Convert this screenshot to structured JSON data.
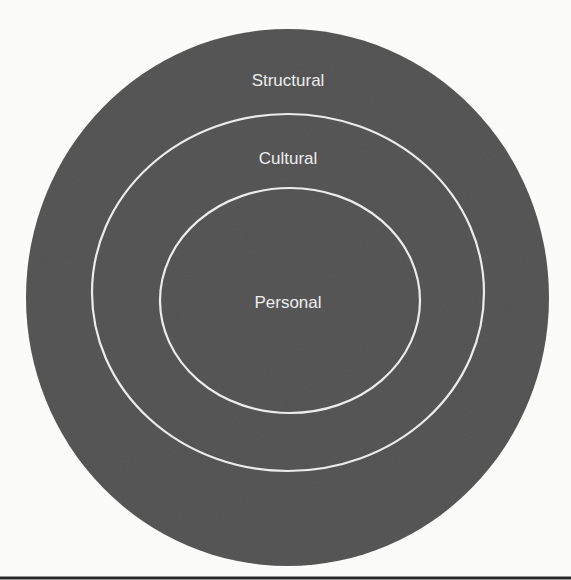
{
  "diagram": {
    "type": "nested-circles",
    "colors": {
      "background": "#fbfbfa",
      "disk_fill": "#5a5a5a",
      "ring_stroke": "#ececec",
      "label_text": "#ededed",
      "bottom_rule": "#2a2a2a"
    },
    "layers": [
      {
        "id": "structural",
        "label": "Structural",
        "level": "outer"
      },
      {
        "id": "cultural",
        "label": "Cultural",
        "level": "middle"
      },
      {
        "id": "personal",
        "label": "Personal",
        "level": "inner"
      }
    ]
  }
}
